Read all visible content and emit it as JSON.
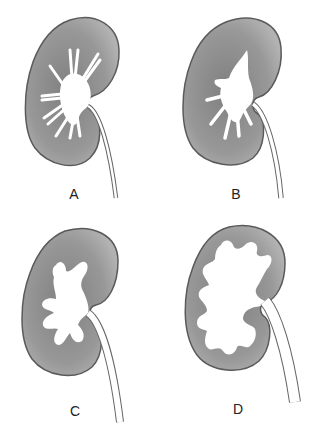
{
  "diagram": {
    "colors": {
      "parenchyma": "#8f8f8f",
      "parenchyma_light": "#b4b4b4",
      "outline": "#5a5a5a",
      "collecting_system": "#ffffff",
      "background": "#ffffff"
    },
    "panels": [
      {
        "id": "A",
        "label": "A",
        "description": "Normal kidney with thin calyces"
      },
      {
        "id": "B",
        "label": "B",
        "description": "Mild dilation of pelvis and calyces"
      },
      {
        "id": "C",
        "label": "C",
        "description": "Moderate dilation with rounded calyces"
      },
      {
        "id": "D",
        "label": "D",
        "description": "Severe dilation with thinned cortex"
      }
    ]
  }
}
